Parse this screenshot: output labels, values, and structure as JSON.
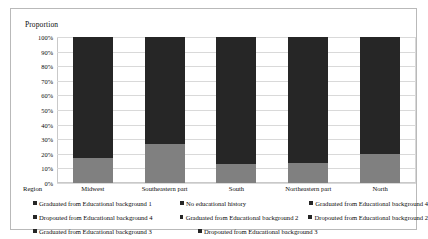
{
  "chart_data": {
    "type": "bar",
    "subtype": "100% stacked bar",
    "title": "",
    "ylabel": "Proportion",
    "xlabel": "Region",
    "categories": [
      "Midwest",
      "Southeastern part",
      "South",
      "Northeastern part",
      "North"
    ],
    "ylim": [
      0,
      100
    ],
    "ytick_labels": [
      "0%",
      "10%",
      "20%",
      "30%",
      "40%",
      "50%",
      "60%",
      "70%",
      "80%",
      "90%",
      "100%"
    ],
    "ytick_values": [
      0,
      10,
      20,
      30,
      40,
      50,
      60,
      70,
      80,
      90,
      100
    ],
    "grid": true,
    "legend_position": "bottom",
    "series": [
      {
        "name": "Graduated from Educational background 1",
        "color": "#808080",
        "values": [
          17,
          27,
          13,
          14,
          20
        ]
      },
      {
        "name": "No educational history",
        "color": "#262626",
        "values": [
          83,
          73,
          87,
          86,
          80
        ]
      },
      {
        "name": "Graduated from Educational background 4",
        "color": "#262626",
        "values": [
          0,
          0,
          0,
          0,
          0
        ]
      },
      {
        "name": "Dropouted from Educational background 4",
        "color": "#262626",
        "values": [
          0,
          0,
          0,
          0,
          0
        ]
      },
      {
        "name": "Graduated from Educational background 2",
        "color": "#262626",
        "values": [
          0,
          0,
          0,
          0,
          0
        ]
      },
      {
        "name": "Dropouted from Educational background 2",
        "color": "#262626",
        "values": [
          0,
          0,
          0,
          0,
          0
        ]
      },
      {
        "name": "Graduated from Educational background 3",
        "color": "#262626",
        "values": [
          0,
          0,
          0,
          0,
          0
        ]
      },
      {
        "name": "Dropouted from Educational background 3",
        "color": "#262626",
        "values": [
          0,
          0,
          0,
          0,
          0
        ]
      }
    ]
  },
  "axis": {
    "y_title": "Proportion",
    "x_title": "Region",
    "ticks": [
      "100%",
      "90%",
      "80%",
      "70%",
      "60%",
      "50%",
      "40%",
      "30%",
      "20%",
      "10%",
      "0%"
    ]
  },
  "categories": {
    "c0": "Midwest",
    "c1": "Southeastern part",
    "c2": "South",
    "c3": "Northeastern part",
    "c4": "North"
  },
  "legend": {
    "rows": [
      [
        "Graduated from Educational background 1",
        "No educational history",
        "Graduated from Educational background 4"
      ],
      [
        "Dropouted from Educational background 4",
        "Graduated from Educational background 2",
        "Dropouted from Educational background 2"
      ],
      [
        "Graduated from Educational background 3",
        "Dropouted from Educational background 3",
        ""
      ]
    ]
  },
  "colors": {
    "segment_bottom": "#808080",
    "segment_top": "#262626",
    "legend_swatch": "#262626",
    "grid": "#d9d9d9",
    "frame": "#b9b9b9"
  }
}
